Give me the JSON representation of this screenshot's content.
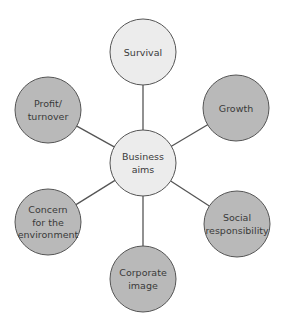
{
  "diagram": {
    "colors": {
      "center_fill": "#ececec",
      "light_fill": "#ececec",
      "dark_fill": "#b9b9b9",
      "stroke": "#555555",
      "text": "#3a3a3a"
    },
    "center": {
      "id": "business-aims",
      "lines": [
        "Business",
        "aims"
      ],
      "cx": 143,
      "cy": 163,
      "r": 33,
      "fill": "light"
    },
    "nodes": [
      {
        "id": "survival",
        "lines": [
          "Survival"
        ],
        "cx": 143,
        "cy": 52,
        "r": 33,
        "fill": "light"
      },
      {
        "id": "growth",
        "lines": [
          "Growth"
        ],
        "cx": 236,
        "cy": 108,
        "r": 33,
        "fill": "dark"
      },
      {
        "id": "social-responsibility",
        "lines": [
          "Social",
          "responsibility"
        ],
        "cx": 237,
        "cy": 224,
        "r": 33,
        "fill": "dark"
      },
      {
        "id": "corporate-image",
        "lines": [
          "Corporate",
          "image"
        ],
        "cx": 143,
        "cy": 279,
        "r": 33,
        "fill": "dark"
      },
      {
        "id": "concern-for-the-environment",
        "lines": [
          "Concern",
          "for the",
          "environment"
        ],
        "cx": 48,
        "cy": 222,
        "r": 33,
        "fill": "dark"
      },
      {
        "id": "profit-turnover",
        "lines": [
          "Profit/",
          "turnover"
        ],
        "cx": 48,
        "cy": 110,
        "r": 33,
        "fill": "dark"
      }
    ]
  }
}
